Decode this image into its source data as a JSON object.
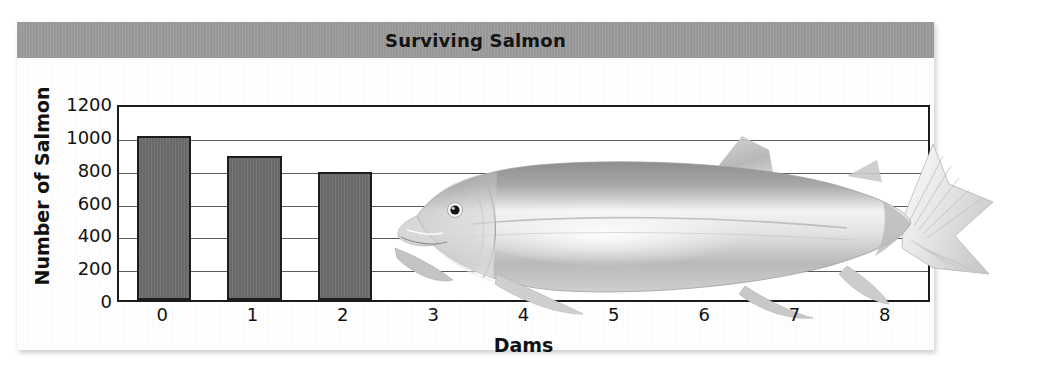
{
  "chart_data": {
    "type": "bar",
    "title": "Surviving Salmon",
    "xlabel": "Dams",
    "ylabel": "Number of Salmon",
    "categories": [
      "0",
      "1",
      "2",
      "3",
      "4",
      "5",
      "6",
      "7",
      "8"
    ],
    "values": [
      1000,
      880,
      780,
      null,
      null,
      null,
      null,
      null,
      null
    ],
    "ylim": [
      0,
      1200
    ],
    "y_ticks": [
      "0",
      "200",
      "400",
      "600",
      "800",
      "1000",
      "1200"
    ],
    "y_tick_values": [
      0,
      200,
      400,
      600,
      800,
      1000,
      1200
    ],
    "grid": true,
    "legend": "none",
    "bar_color": "#6e6e6e",
    "bar_border_color": "#1d1d1d",
    "title_band_color": "#9c9c9c",
    "panel_color": "#f0f0f0",
    "plot_background": "#ffffff",
    "axis_color": "#1b1b1b",
    "gridline_color": "#5a5a5a",
    "annotations": [
      {
        "name": "salmon-illustration",
        "description": "Grayscale illustration of a salmon overlaying the right portion of the plot area"
      }
    ]
  }
}
